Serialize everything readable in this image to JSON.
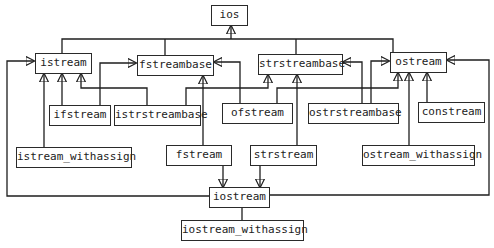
{
  "diagram": {
    "type": "class-hierarchy",
    "nodes": {
      "ios": "ios",
      "istream": "istream",
      "fstreambase": "fstreambase",
      "strstreambase": "strstreambase",
      "ostream": "ostream",
      "ifstream": "ifstream",
      "istrstreambase": "istrstreambase",
      "ofstream": "ofstream",
      "ostrstreambase": "ostrstreambase",
      "constream": "constream",
      "istream_withassign": "istream_withassign",
      "fstream": "fstream",
      "strstream": "strstream",
      "ostream_withassign": "ostream_withassign",
      "iostream": "iostream",
      "iostream_withassign": "iostream_withassign"
    },
    "edges": [
      {
        "from": "istream",
        "to": "ios"
      },
      {
        "from": "fstreambase",
        "to": "ios"
      },
      {
        "from": "strstreambase",
        "to": "ios"
      },
      {
        "from": "ostream",
        "to": "ios"
      },
      {
        "from": "ifstream",
        "to": "istream"
      },
      {
        "from": "ifstream",
        "to": "fstreambase"
      },
      {
        "from": "istrstreambase",
        "to": "istream"
      },
      {
        "from": "istrstreambase",
        "to": "strstreambase"
      },
      {
        "from": "ofstream",
        "to": "fstreambase"
      },
      {
        "from": "ofstream",
        "to": "ostream"
      },
      {
        "from": "ostrstreambase",
        "to": "strstreambase"
      },
      {
        "from": "ostrstreambase",
        "to": "ostream"
      },
      {
        "from": "constream",
        "to": "ostream"
      },
      {
        "from": "istream_withassign",
        "to": "istream"
      },
      {
        "from": "fstream",
        "to": "fstreambase"
      },
      {
        "from": "fstream",
        "to": "iostream"
      },
      {
        "from": "strstream",
        "to": "strstreambase"
      },
      {
        "from": "strstream",
        "to": "iostream"
      },
      {
        "from": "ostream_withassign",
        "to": "ostream"
      },
      {
        "from": "iostream",
        "to": "istream"
      },
      {
        "from": "iostream",
        "to": "ostream"
      },
      {
        "from": "iostream_withassign",
        "to": "iostream"
      }
    ]
  }
}
